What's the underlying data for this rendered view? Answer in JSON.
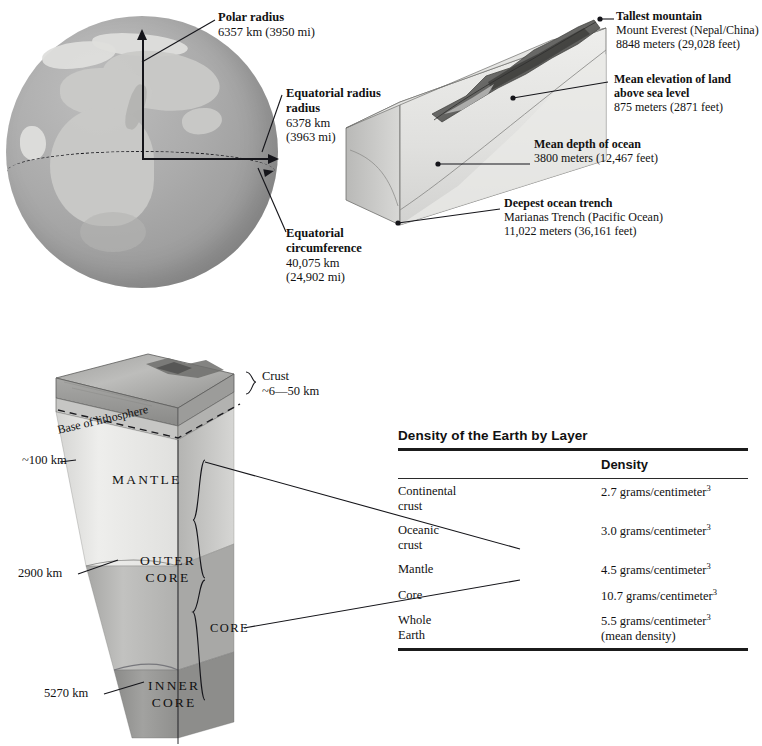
{
  "figure": {
    "globe": {
      "name": "Earth globe with radii",
      "labels": [
        {
          "title": "Polar radius",
          "value": "6357 km (3950 mi)"
        },
        {
          "title": "Equatorial radius",
          "value_1": "6378 km",
          "value_2": "(3963 mi)"
        },
        {
          "title_1": "Equatorial",
          "title_2": "circumference",
          "value_1": "40,075 km",
          "value_2": "(24,902 mi)"
        }
      ]
    },
    "block": {
      "name": "Terrain relief block diagram",
      "labels": [
        {
          "title": "Tallest mountain",
          "line_1": "Mount Everest (Nepal/China)",
          "line_2": "8848 meters (29,028 feet)"
        },
        {
          "title_1": "Mean elevation of land",
          "title_2": "above sea level",
          "line_1": "875 meters (2871 feet)"
        },
        {
          "title": "Mean depth of ocean",
          "line_1": "3800 meters (12,467 feet)"
        },
        {
          "title": "Deepest ocean trench",
          "line_1": "Marianas Trench (Pacific Ocean)",
          "line_2": "11,022 meters (36,161 feet)"
        }
      ]
    },
    "wedge": {
      "name": "Earth interior cutaway wedge",
      "crust_label": "Crust",
      "crust_value": "~6—50 km",
      "lithosphere_label": "Base of lithosphere",
      "depth_100": "~100 km",
      "depth_2900": "2900 km",
      "depth_5270": "5270 km",
      "mantle_label": "MANTLE",
      "outer_core_label_1": "OUTER",
      "outer_core_label_2": "CORE",
      "inner_core_label_1": "INNER",
      "inner_core_label_2": "CORE",
      "core_bracket_label": "CORE"
    }
  },
  "table": {
    "title": "Density of the Earth by Layer",
    "columns": [
      "",
      "Density"
    ],
    "rows": [
      {
        "layer_1": "Continental",
        "layer_2": "crust",
        "density": "2.7 grams/centimeter",
        "exp": "3",
        "note": ""
      },
      {
        "layer_1": "Oceanic",
        "layer_2": "crust",
        "density": "3.0 grams/centimeter",
        "exp": "3",
        "note": ""
      },
      {
        "layer_1": "Mantle",
        "layer_2": "",
        "density": "4.5 grams/centimeter",
        "exp": "3",
        "note": ""
      },
      {
        "layer_1": "Core",
        "layer_2": "",
        "density": "10.7 grams/centimeter",
        "exp": "3",
        "note": ""
      },
      {
        "layer_1": "Whole",
        "layer_2": "Earth",
        "density": "5.5 grams/centimeter",
        "exp": "3",
        "note": "(mean density)"
      }
    ]
  },
  "colors": {
    "ink": "#15151a",
    "globe_gray": "#a3a3a3",
    "mantle_gray": "#e2e2e0",
    "outer_core_gray": "#b8b8b6",
    "inner_core_gray": "#9a9a98"
  }
}
